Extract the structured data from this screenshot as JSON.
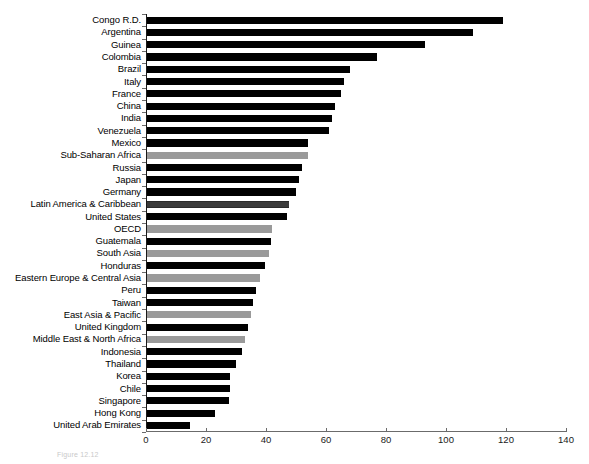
{
  "chart_data": {
    "type": "bar",
    "orientation": "horizontal",
    "title": "",
    "xlabel": "",
    "ylabel": "",
    "xlim": [
      0,
      140
    ],
    "xticks": [
      0,
      20,
      40,
      60,
      80,
      100,
      120,
      140
    ],
    "grid": false,
    "legend": null,
    "colors": {
      "country": "#000000",
      "region": "#9a9a9a",
      "hatched": "#3a3a3a",
      "axis": "#6b6b6b"
    },
    "categories": [
      "Congo R.D.",
      "Argentina",
      "Guinea",
      "Colombia",
      "Brazil",
      "Italy",
      "France",
      "China",
      "India",
      "Venezuela",
      "Mexico",
      "Sub-Saharan Africa",
      "Russia",
      "Japan",
      "Germany",
      "Latin America & Caribbean",
      "United States",
      "OECD",
      "Guatemala",
      "South Asia",
      "Honduras",
      "Eastern Europe & Central Asia",
      "Peru",
      "Taiwan",
      "East Asia & Pacific",
      "United Kingdom",
      "Middle East & North Africa",
      "Indonesia",
      "Thailand",
      "Korea",
      "Chile",
      "Singapore",
      "Hong Kong",
      "United Arab Emirates"
    ],
    "values": [
      119,
      109,
      93,
      77,
      68,
      66,
      65,
      63,
      62,
      61,
      54,
      54,
      52,
      51,
      50,
      47.5,
      47,
      42,
      41.5,
      41,
      39.5,
      38,
      36.5,
      35.5,
      35,
      34,
      33,
      32,
      30,
      28,
      28,
      27.5,
      23,
      14.5
    ],
    "styles": [
      "solid-dark",
      "solid-dark",
      "solid-dark",
      "solid-dark",
      "solid-dark",
      "solid-dark",
      "solid-dark",
      "solid-dark",
      "solid-dark",
      "solid-dark",
      "solid-dark",
      "solid-gray",
      "solid-dark",
      "solid-dark",
      "solid-dark",
      "hatch",
      "solid-dark",
      "solid-gray",
      "solid-dark",
      "solid-gray",
      "solid-dark",
      "solid-gray",
      "solid-dark",
      "solid-dark",
      "solid-gray",
      "solid-dark",
      "solid-gray",
      "solid-dark",
      "solid-dark",
      "solid-dark",
      "solid-dark",
      "solid-dark",
      "solid-dark",
      "solid-dark"
    ]
  },
  "caption": {
    "text": "Figure 12.12"
  }
}
